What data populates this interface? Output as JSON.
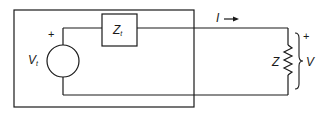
{
  "diagram": {
    "type": "circuit-schematic",
    "colors": {
      "line": "#1a1a1a",
      "background": "#ffffff"
    },
    "source": {
      "voltage_label": "V",
      "voltage_subscript": "t",
      "polarity_plus": "+",
      "impedance_label": "Z",
      "impedance_subscript": "t"
    },
    "current": {
      "label": "I",
      "direction": "right"
    },
    "load": {
      "impedance_label": "Z",
      "voltage_label": "V",
      "polarity_plus": "+"
    }
  }
}
